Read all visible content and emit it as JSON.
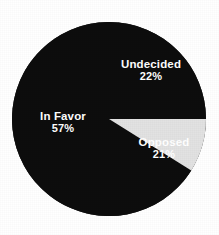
{
  "chart_data": {
    "type": "pie",
    "title": "",
    "subtitle": "",
    "xlabel": "",
    "ylabel": "",
    "legend_position": "none",
    "grid": false,
    "labels_inside": true,
    "total_percent": 100,
    "background_color": "#ffffff",
    "categories": [
      "In Favor",
      "Undecided",
      "Opposed"
    ],
    "values": [
      57,
      22,
      21
    ],
    "value_suffix": "%",
    "slices": [
      {
        "name": "In Favor",
        "value": 57,
        "value_text": "57%",
        "color": "#0a0a0a",
        "label_color": "#ffffff",
        "start_angle_deg": 32,
        "end_angle_deg": 317
      },
      {
        "name": "Undecided",
        "value": 22,
        "value_text": "22%",
        "color": "#0a0a0a",
        "label_color": "#ffffff",
        "start_angle_deg": 317,
        "end_angle_deg": 360
      },
      {
        "name": "Opposed",
        "value": 21,
        "value_text": "21%",
        "color": "#e2e2e2",
        "label_color": "#ffffff",
        "start_angle_deg": 0,
        "end_angle_deg": 32
      }
    ],
    "geometry": {
      "center_x": 109,
      "center_y": 119,
      "radius": 97
    }
  }
}
